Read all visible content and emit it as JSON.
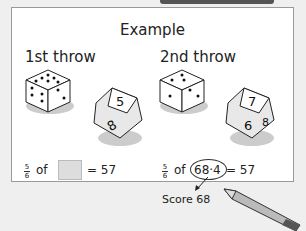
{
  "title": "Example",
  "first": {
    "heading": "1st throw",
    "d6_face_top": "2",
    "d6_face_left": "6",
    "d10_faces": [
      "5",
      "3",
      "8",
      "2"
    ],
    "frac_num": "5",
    "frac_den": "6",
    "of": "of",
    "equals": "= 57"
  },
  "second": {
    "heading": "2nd throw",
    "d6_face_top": "1",
    "d6_face_left": "5",
    "d10_faces": [
      "7",
      "4",
      "6",
      "8"
    ],
    "frac_num": "5",
    "frac_den": "6",
    "of": "of",
    "answer": "68·4",
    "equals": "= 57",
    "score": "Score 68"
  }
}
